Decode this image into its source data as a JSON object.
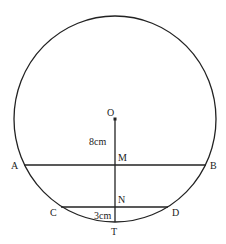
{
  "diagram": {
    "type": "geometry-circle-chords",
    "colors": {
      "stroke": "#222222",
      "label": "#222222",
      "background": "#ffffff"
    },
    "circle": {
      "cx": 115,
      "cy": 119,
      "rx": 101,
      "ry": 103,
      "center_label": "O"
    },
    "points": {
      "O": {
        "label": "O",
        "x": 115,
        "y": 119
      },
      "A": {
        "label": "A",
        "x": 24,
        "y": 165
      },
      "B": {
        "label": "B",
        "x": 206,
        "y": 165
      },
      "C": {
        "label": "C",
        "x": 61,
        "y": 207
      },
      "D": {
        "label": "D",
        "x": 168,
        "y": 207
      },
      "M": {
        "label": "M",
        "x": 115,
        "y": 165
      },
      "N": {
        "label": "N",
        "x": 115,
        "y": 207
      },
      "T": {
        "label": "T",
        "x": 115,
        "y": 222
      }
    },
    "segments": [
      {
        "from": "A",
        "to": "B",
        "name": "chord-AB"
      },
      {
        "from": "C",
        "to": "D",
        "name": "chord-CD"
      },
      {
        "from": "O",
        "to": "T",
        "name": "radius-OT"
      }
    ],
    "measurements": {
      "OM": "8cm",
      "NT": "3cm"
    }
  }
}
